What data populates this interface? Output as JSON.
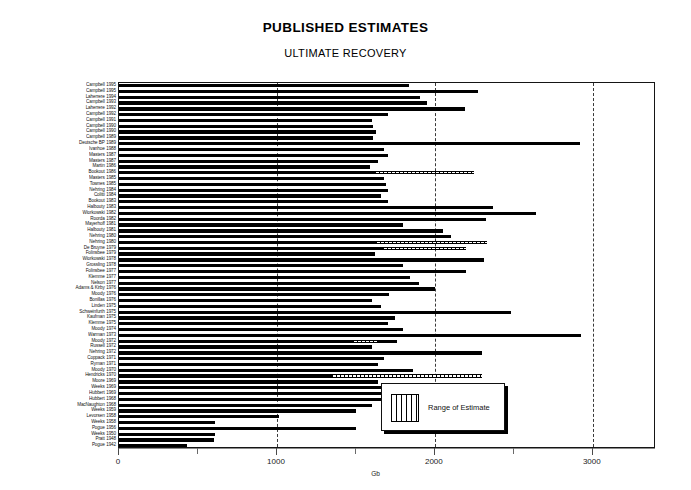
{
  "chart": {
    "title": "PUBLISHED ESTIMATES",
    "subtitle": "ULTIMATE RECOVERY",
    "xlabel": "Gb",
    "legend_label": "Range of Estimate"
  },
  "legend": {
    "label": "Range of Estimate"
  },
  "chart_data": {
    "type": "bar",
    "orientation": "horizontal",
    "title": "PUBLISHED ESTIMATES",
    "subtitle": "ULTIMATE RECOVERY",
    "xlabel": "Gb",
    "ylabel": "",
    "xlim": [
      0,
      3400
    ],
    "ticks": [
      0,
      1000,
      2000,
      3000
    ],
    "tick_labels": [
      "0",
      "1000",
      "2000",
      "3000"
    ],
    "grid": "vertical dashed at 1000, 2000, 3000",
    "legend_position": "inside lower right",
    "series": [
      {
        "name": "Estimate",
        "style": "solid-black"
      },
      {
        "name": "Range of Estimate",
        "style": "vertical-hatch"
      }
    ],
    "categories": [
      "Campbell",
      "Campbell",
      "Laherrere",
      "Campbell",
      "Laherrere",
      "Campbell",
      "Campbell",
      "Campbell",
      "Campbell",
      "Campbell",
      "Deutsche BP",
      "Ivanhoe",
      "Masters",
      "Masters",
      "Martin",
      "Bookout",
      "Masters",
      "Townes",
      "Nehring",
      "Colitti",
      "Bookout",
      "Halbouty",
      "Wiorkowski",
      "Roorda",
      "Mayerhoff",
      "Halbouty",
      "Nehring",
      "Nehring",
      "De Bruyne",
      "Folinsbee",
      "Wiorkowski",
      "Grossling",
      "Folinsbee",
      "Klemme",
      "Nelson",
      "Adams & Kirby",
      "Moody",
      "Bonillas",
      "Linden",
      "Schweinfurth",
      "Kaufman",
      "Klemme",
      "Moody",
      "Warman",
      "Moody",
      "Russell",
      "Nehring",
      "Coppack",
      "Ryman",
      "Moody",
      "Hendricks",
      "Moore",
      "Weeks",
      "Hubbert",
      "Hubbert",
      "MacNaughton",
      "Weeks",
      "Levorsen",
      "Weeks",
      "Pogue",
      "Weeks",
      "Pratt",
      "Pogue"
    ],
    "years": [
      "1995",
      "1995",
      "1994",
      "1993",
      "1992",
      "1992",
      "1991",
      "1990",
      "1990",
      "1989",
      "1989",
      "1988",
      "1987",
      "1987",
      "1986",
      "1986",
      "1985",
      "1985",
      "1984",
      "1984",
      "1983",
      "1983",
      "1982",
      "1982",
      "1981",
      "1981",
      "1980",
      "1980",
      "1979",
      "1979",
      "1978",
      "1978",
      "1977",
      "1977",
      "1977",
      "1976",
      "1976",
      "1976",
      "1975",
      "1975",
      "1975",
      "1975",
      "1974",
      "1973",
      "1972",
      "1972",
      "1972",
      "1971",
      "1971",
      "1970",
      "1970",
      "1969",
      "1969",
      "1969",
      "1968",
      "1968",
      "1959",
      "1958",
      "1958",
      "1956",
      "1950",
      "1948",
      "1942"
    ],
    "values": [
      1835,
      2275,
      1905,
      1950,
      2190,
      1700,
      1600,
      1610,
      1630,
      1610,
      2920,
      1680,
      1700,
      1640,
      1590,
      1660,
      1680,
      1690,
      1700,
      1660,
      1700,
      2370,
      2640,
      2325,
      1800,
      2050,
      2100,
      2000,
      1745,
      1620,
      2310,
      1800,
      2200,
      1840,
      1900,
      2000,
      1710,
      1600,
      1660,
      2480,
      1750,
      1700,
      1800,
      2925,
      1760,
      1600,
      2300,
      1680,
      1640,
      1860,
      2170,
      1640,
      2250,
      2100,
      2100,
      1600,
      1500,
      1010,
      610,
      1500,
      610,
      600,
      430
    ],
    "range_bars": [
      {
        "index": 15,
        "start": 1620,
        "end": 2250
      },
      {
        "index": 27,
        "start": 1630,
        "end": 2330
      },
      {
        "index": 28,
        "start": 1670,
        "end": 2200
      },
      {
        "index": 44,
        "start": 1480,
        "end": 1640
      },
      {
        "index": 50,
        "start": 1350,
        "end": 2300
      }
    ]
  }
}
